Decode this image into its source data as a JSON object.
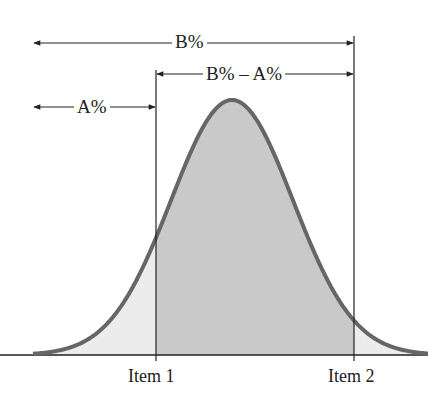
{
  "diagram": {
    "type": "normal-distribution-cumulative-percent",
    "labels": {
      "b_percent": "B%",
      "b_minus_a": "B% – A%",
      "a_percent": "A%"
    },
    "x_ticks": [
      "Item 1",
      "Item 2"
    ],
    "colors": {
      "curve": "#666666",
      "outer_fill": "#ececec",
      "inner_fill": "#c9c9c9",
      "lines": "#222222"
    }
  },
  "chart_data": {
    "type": "area",
    "title": "",
    "x_ticks": [
      "Item 1",
      "Item 2"
    ],
    "annotations": [
      {
        "label": "B%",
        "span": "left tail to Item 2"
      },
      {
        "label": "B% – A%",
        "span": "Item 1 to Item 2"
      },
      {
        "label": "A%",
        "span": "left tail to Item 1"
      }
    ],
    "mean_px": 232,
    "sigma_px": 61,
    "item1_px": 156,
    "item2_px": 354
  }
}
